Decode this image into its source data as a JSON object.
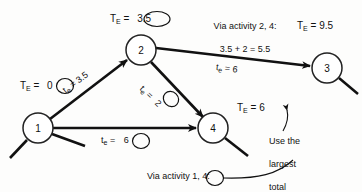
{
  "figure": {
    "type": "pert-cpm-network-diagram"
  },
  "nodes": [
    {
      "id": "1",
      "label": "1",
      "cx": 38,
      "cy": 128,
      "r": 15
    },
    {
      "id": "2",
      "label": "2",
      "cx": 141,
      "cy": 50,
      "r": 15
    },
    {
      "id": "3",
      "label": "3",
      "cx": 327,
      "cy": 68,
      "r": 15
    },
    {
      "id": "4",
      "label": "4",
      "cx": 213,
      "cy": 128,
      "r": 15
    }
  ],
  "edges": [
    {
      "from": "1",
      "to": "2",
      "duration_label": "t",
      "duration_sub": "e",
      "duration_value": "3.5",
      "circled": false
    },
    {
      "from": "2",
      "to": "4",
      "duration_label": "t",
      "duration_sub": "e",
      "duration_value": "2",
      "circled": true
    },
    {
      "from": "1",
      "to": "4",
      "duration_label": "t",
      "duration_sub": "e",
      "duration_value": "6",
      "circled": true
    },
    {
      "from": "2",
      "to": "3",
      "duration_label": "t",
      "duration_sub": "e",
      "duration_value": "6",
      "circled": false
    }
  ],
  "edge_labels": {
    "e12": {
      "prefix": "t",
      "sub": "e",
      "eq": "=",
      "value": "3.5"
    },
    "e24": {
      "prefix": "t",
      "sub": "e",
      "eq": "=",
      "value": "2"
    },
    "e14": {
      "prefix": "t",
      "sub": "e",
      "eq": "=",
      "value": "6"
    },
    "e23": {
      "prefix": "t",
      "sub": "e",
      "eq": "=",
      "value": "6"
    }
  },
  "te_labels": {
    "node1": {
      "prefix": "T",
      "sub": "E",
      "eq": "=",
      "value": "0",
      "circled": true
    },
    "node2": {
      "prefix": "T",
      "sub": "E",
      "eq": "=",
      "value": "3.5",
      "circled": true
    },
    "node3": {
      "prefix": "T",
      "sub": "E",
      "eq": "=",
      "value": "9.5",
      "circled": false
    },
    "node4": {
      "prefix": "T",
      "sub": "E",
      "eq": "=",
      "value": "6",
      "circled": false
    }
  },
  "annotations": {
    "via_2_4": {
      "line1": "Via activity 2, 4:",
      "line2": "3.5 + 2 = 5.5"
    },
    "via_1_4": {
      "line1": "Via activity 1, 4:",
      "line2_prefix": "0 + 6 =",
      "line2_value": "6"
    },
    "use_largest": {
      "line1": "Use the",
      "line2": "largest",
      "line3": "total"
    }
  },
  "colors": {
    "ink": "#111111",
    "paper": "#fdfdfc",
    "node_stroke": "#222222"
  }
}
